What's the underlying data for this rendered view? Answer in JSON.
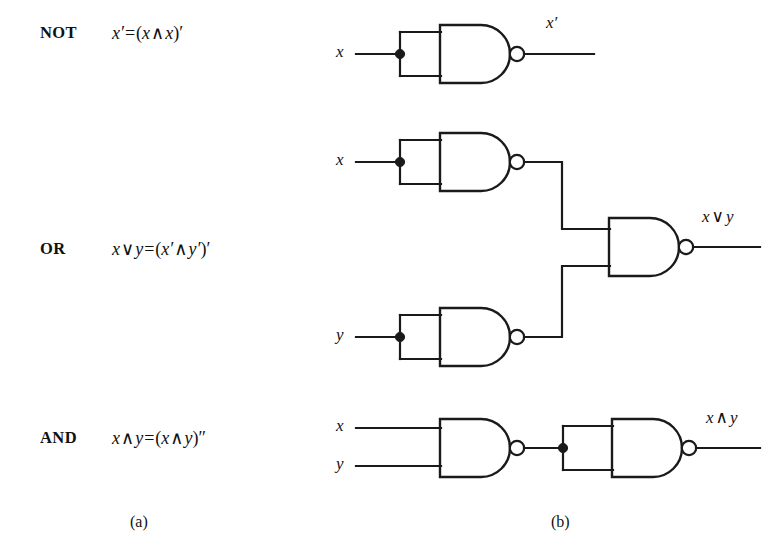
{
  "figure": {
    "panels": [
      {
        "id": "a",
        "caption": "(a)"
      },
      {
        "id": "b",
        "caption": "(b)"
      }
    ],
    "colors": {
      "ink": "#1a1a1a",
      "background": "#ffffff"
    }
  },
  "rows": [
    {
      "name": "NOT",
      "label": "NOT",
      "formula": {
        "text": "x′ = (x ∧ x)′",
        "lhs": "x′",
        "eq": "=",
        "rhs_open": "(",
        "rhs_a": "x",
        "rhs_op": "∧",
        "rhs_b": "x",
        "rhs_close": ")",
        "rhs_prime": "′"
      },
      "circuit": {
        "inputs": [
          {
            "label": "x"
          }
        ],
        "output": {
          "label": "x′"
        },
        "gate_count": 1
      }
    },
    {
      "name": "OR",
      "label": "OR",
      "formula": {
        "text": "x ∨ y = (x′ ∧ y′)′",
        "lhs_a": "x",
        "lhs_op": "∨",
        "lhs_b": "y",
        "eq": "=",
        "rhs_open": "(",
        "rhs_a": "x′",
        "rhs_op": "∧",
        "rhs_b": "y′",
        "rhs_close": ")",
        "rhs_prime": "′"
      },
      "circuit": {
        "inputs": [
          {
            "label": "x"
          },
          {
            "label": "y"
          }
        ],
        "output": {
          "label_a": "x",
          "label_op": "∨",
          "label_b": "y"
        },
        "gate_count": 3
      }
    },
    {
      "name": "AND",
      "label": "AND",
      "formula": {
        "text": "x ∧ y = (x ∧ y)″",
        "lhs_a": "x",
        "lhs_op": "∧",
        "lhs_b": "y",
        "eq": "=",
        "rhs_open": "(",
        "rhs_a": "x",
        "rhs_op": "∧",
        "rhs_b": "y",
        "rhs_close": ")",
        "rhs_prime": "″"
      },
      "circuit": {
        "inputs": [
          {
            "label": "x"
          },
          {
            "label": "y"
          }
        ],
        "output": {
          "label_a": "x",
          "label_op": "∧",
          "label_b": "y"
        },
        "gate_count": 2
      }
    }
  ]
}
